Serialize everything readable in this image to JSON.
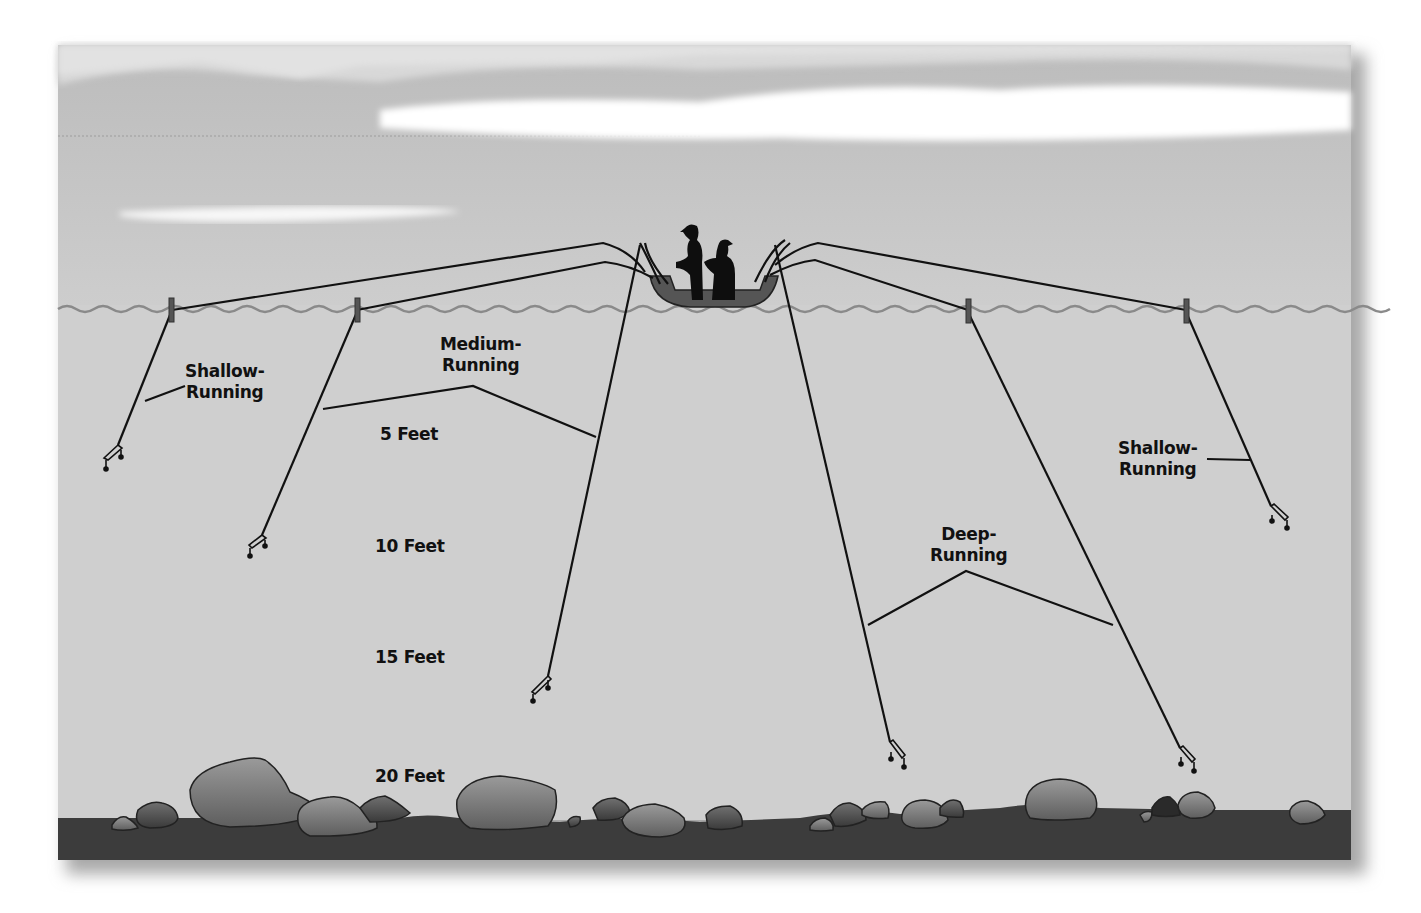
{
  "diagram": {
    "depth_markers": [
      {
        "label": "5 Feet",
        "x": 380,
        "y": 424
      },
      {
        "label": "10 Feet",
        "x": 375,
        "y": 536
      },
      {
        "label": "15 Feet",
        "x": 375,
        "y": 647
      },
      {
        "label": "20 Feet",
        "x": 375,
        "y": 766
      }
    ],
    "lure_groups": [
      {
        "line1": "Shallow-",
        "line2": "Running",
        "x": 180,
        "y": 361,
        "side": "left"
      },
      {
        "line1": "Medium-",
        "line2": "Running",
        "x": 440,
        "y": 334,
        "side": "left"
      },
      {
        "line1": "Deep-",
        "line2": "Running",
        "x": 930,
        "y": 524,
        "side": "right"
      },
      {
        "line1": "Shallow-",
        "line2": "Running",
        "x": 1115,
        "y": 438,
        "side": "right"
      }
    ],
    "colors": {
      "sky": "#c2c2c2",
      "cloud": "#ffffff",
      "water": "#cfcfcf",
      "bottom": "#3c3c3c",
      "rock": "#808080",
      "line": "#111111",
      "wave": "#8a8a8a",
      "board": "#555555"
    }
  }
}
